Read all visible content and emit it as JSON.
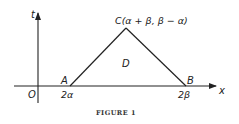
{
  "figure": {
    "caption": "FIGURE 1",
    "axes": {
      "x_label": "x",
      "t_label": "t",
      "origin_label": "O"
    },
    "points": {
      "A": {
        "label": "A",
        "coord_label": "2α"
      },
      "B": {
        "label": "B",
        "coord_label": "2β"
      },
      "C": {
        "label": "C(α + β, β − α)"
      }
    },
    "region_label": "D",
    "colors": {
      "line": "#222222",
      "text": "#222222"
    }
  }
}
